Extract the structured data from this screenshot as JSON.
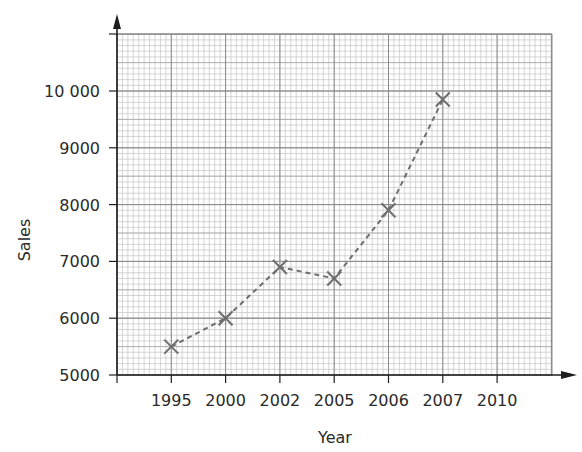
{
  "chart_data": {
    "type": "line",
    "title": "",
    "xlabel": "Year",
    "ylabel": "Sales",
    "categories": [
      "1995",
      "2000",
      "2002",
      "2005",
      "2006",
      "2007",
      "2010"
    ],
    "series": [
      {
        "name": "Sales",
        "marker": "x",
        "line_style": "dashed",
        "x": [
          "1995",
          "2000",
          "2002",
          "2005",
          "2006",
          "2007"
        ],
        "values": [
          5500,
          6000,
          6900,
          6700,
          7900,
          9850
        ]
      }
    ],
    "y_ticks": [
      5000,
      6000,
      7000,
      8000,
      9000,
      10000
    ],
    "y_tick_labels": [
      "5000",
      "6000",
      "7000",
      "8000",
      "9000",
      "10 000"
    ],
    "ylim": [
      5000,
      11000
    ],
    "grid": true,
    "legend": "none"
  },
  "colors": {
    "axis": "#1e1e1e",
    "major_grid": "#8a8a8a",
    "minor_grid": "#c4c4c4",
    "series": "#6e6e6e"
  }
}
